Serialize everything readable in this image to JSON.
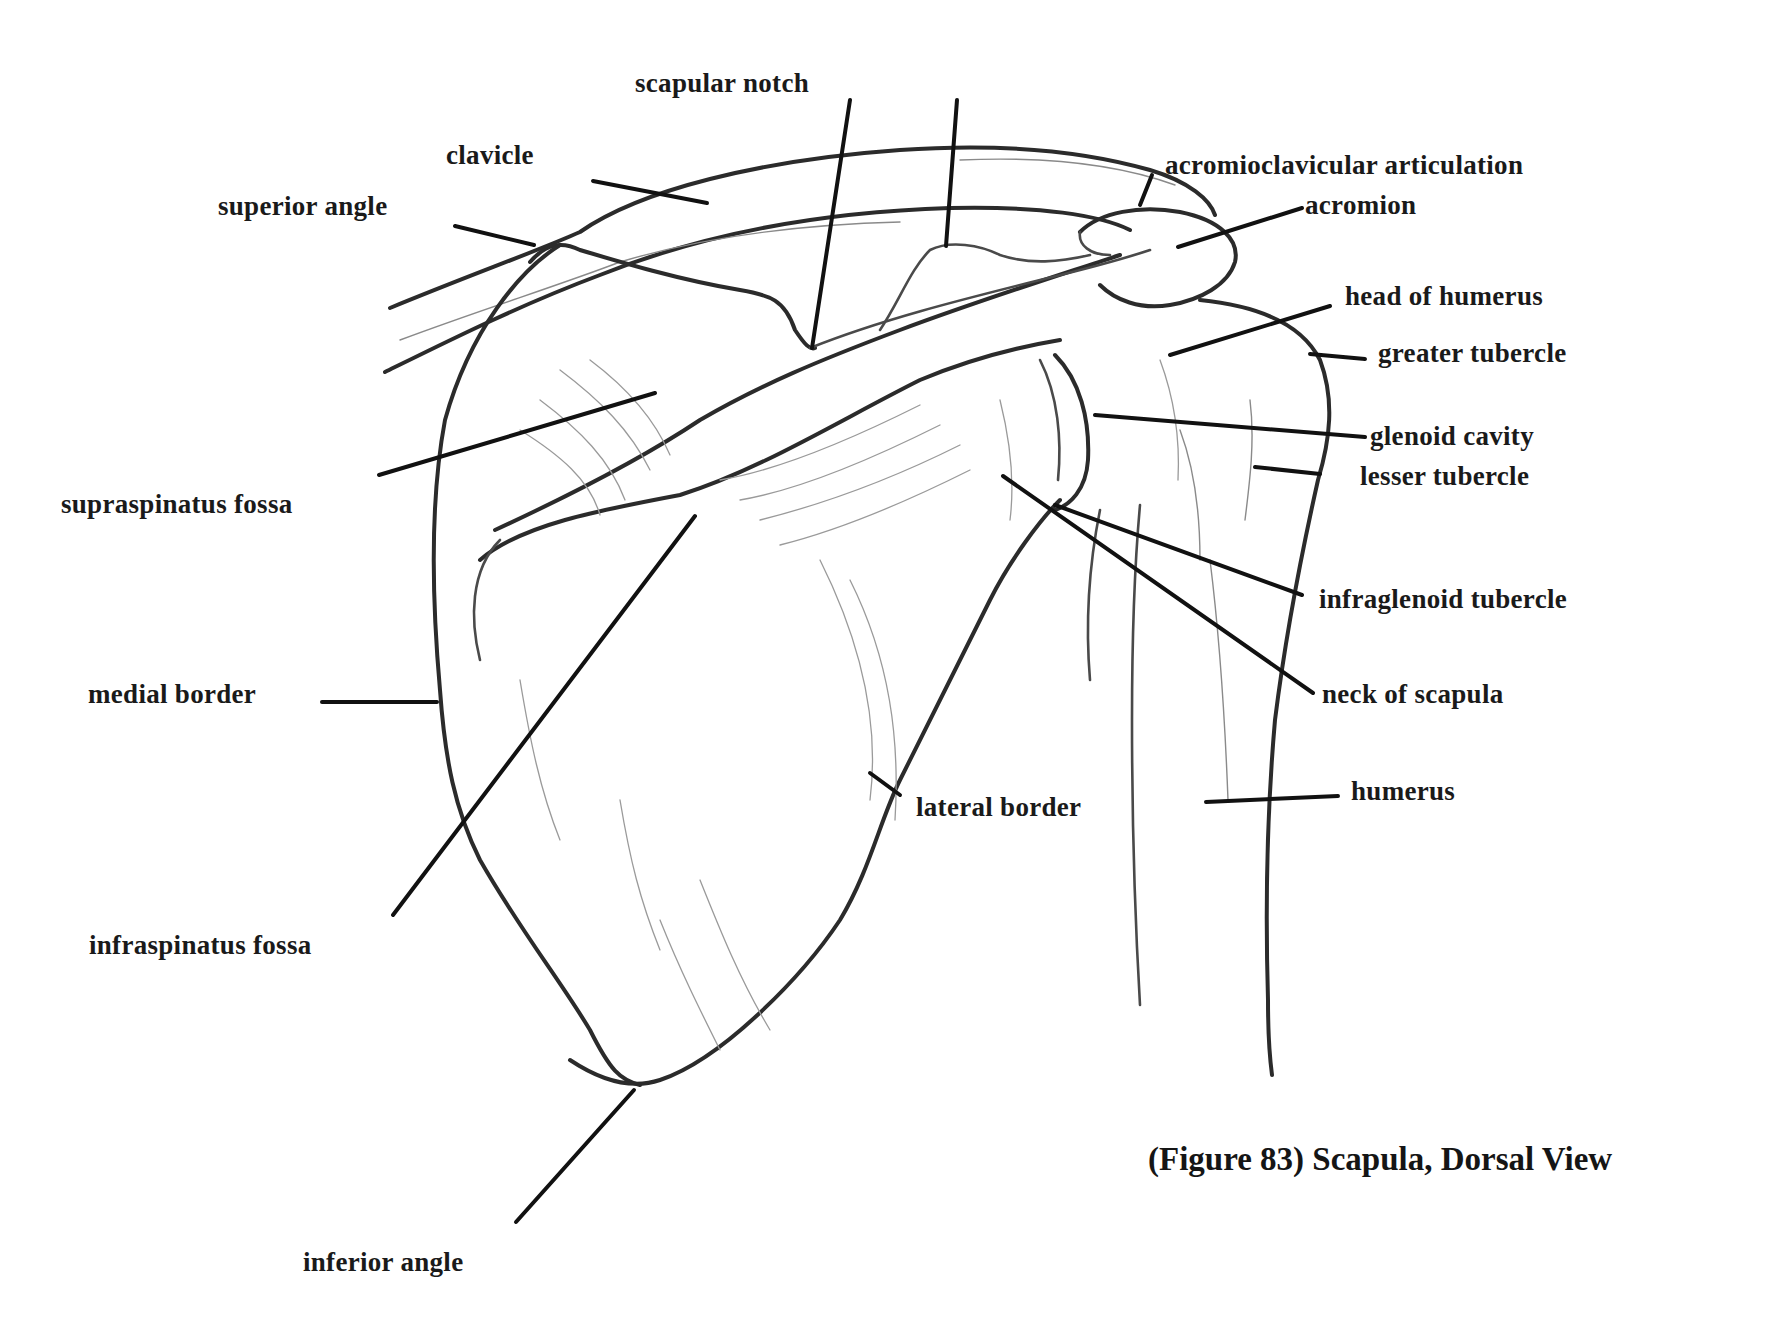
{
  "figure": {
    "caption": "(Figure 83) Scapula, Dorsal View",
    "subject": "Scapula, Dorsal View",
    "figure_number": 83
  },
  "labels": {
    "scapular_notch": "scapular notch",
    "clavicle": "clavicle",
    "superior_angle": "superior angle",
    "acromioclavicular_articulation": "acromioclavicular articulation",
    "acromion": "acromion",
    "head_of_humerus": "head of humerus",
    "greater_tubercle": "greater tubercle",
    "glenoid_cavity": "glenoid cavity",
    "lesser_tubercle": "lesser tubercle",
    "supraspinatus_fossa": "supraspinatus fossa",
    "infraglenoid_tubercle": "infraglenoid tubercle",
    "medial_border": "medial border",
    "neck_of_scapula": "neck of scapula",
    "humerus": "humerus",
    "lateral_border": "lateral border",
    "infraspinatus_fossa": "infraspinatus fossa",
    "inferior_angle": "inferior angle"
  },
  "colors": {
    "background": "#ffffff",
    "ink": "#1a1a1a",
    "pencil": "#3a3a3a"
  }
}
